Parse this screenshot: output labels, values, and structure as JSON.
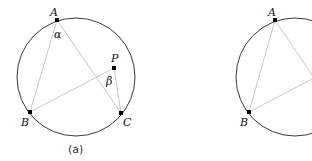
{
  "figure_a": {
    "caption": "(a)",
    "points": {
      "A": {
        "label": "A",
        "x": 57,
        "y": 20
      },
      "B": {
        "label": "B",
        "x": 30,
        "y": 112
      },
      "C": {
        "label": "C",
        "x": 121,
        "y": 113
      },
      "P": {
        "label": "P",
        "x": 114,
        "y": 68
      }
    },
    "angle_labels": {
      "alpha": "α",
      "beta": "β"
    }
  },
  "figure_b": {
    "points": {
      "A": {
        "label": "A",
        "x": 275,
        "y": 20
      },
      "B": {
        "label": "B",
        "x": 249,
        "y": 112
      }
    }
  },
  "colors": {
    "circle": "#3a3a3a",
    "chord": "#c8c8c8",
    "point": "#000000"
  }
}
